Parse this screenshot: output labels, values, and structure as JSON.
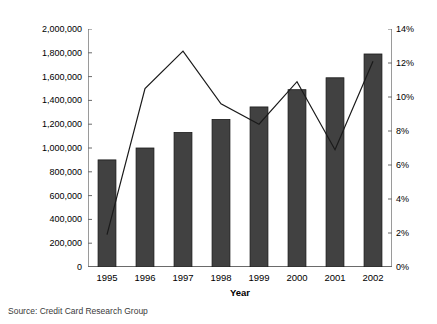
{
  "chart_data": {
    "type": "bar",
    "title": "",
    "subtitle": "",
    "xlabel": "Year",
    "ylabel": "Transactions (000s)",
    "ylabel_right": "",
    "categories": [
      "1995",
      "1996",
      "1997",
      "1998",
      "1999",
      "2000",
      "2001",
      "2002"
    ],
    "grid": false,
    "legend": "none",
    "axes": {
      "left": {
        "label": "Transactions (000s)",
        "ylim": [
          0,
          2000000
        ],
        "tick_step": 200000,
        "tick_labels": [
          "2,000,000",
          "1,800,000",
          "1,600,000",
          "1,400,000",
          "1,200,000",
          "1,000,000",
          "800,000",
          "600,000",
          "400,000",
          "200,000",
          "0"
        ],
        "tick_values": [
          2000000,
          1800000,
          1600000,
          1400000,
          1200000,
          1000000,
          800000,
          600000,
          400000,
          200000,
          0
        ]
      },
      "right": {
        "label": "",
        "ylim": [
          0,
          14
        ],
        "tick_step": 2,
        "tick_labels": [
          "14%",
          "12%",
          "10%",
          "8%",
          "6%",
          "4%",
          "2%",
          "0%"
        ],
        "tick_values": [
          14,
          12,
          10,
          8,
          6,
          4,
          2,
          0
        ]
      }
    },
    "series": [
      {
        "name": "Transactions (000s)",
        "type": "bar",
        "axis": "left",
        "color": "#414141",
        "values": [
          900000,
          1000000,
          1130000,
          1240000,
          1345000,
          1490000,
          1590000,
          1790000
        ]
      },
      {
        "name": "Growth",
        "type": "line",
        "axis": "right",
        "color": "#1a1a1a",
        "values": [
          1.9,
          10.5,
          12.7,
          9.6,
          8.4,
          10.9,
          6.9,
          12.1
        ]
      }
    ]
  },
  "footer": {
    "source": "Source: Credit Card Research Group"
  }
}
